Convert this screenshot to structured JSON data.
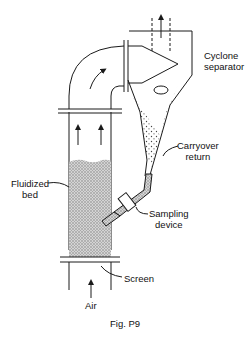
{
  "figure": {
    "caption": "Fig. P9",
    "labels": {
      "cyclone_line1": "Cyclone",
      "cyclone_line2": "separator",
      "carryover_line1": "Carryover",
      "carryover_line2": "return",
      "fluidized_line1": "Fluidized",
      "fluidized_line2": "bed",
      "sampling_line1": "Sampling",
      "sampling_line2": "device",
      "screen": "Screen",
      "air": "Air"
    },
    "colors": {
      "line": "#1a1a1a",
      "bed_fill": "#bdbdbd",
      "background": "#ffffff"
    }
  }
}
